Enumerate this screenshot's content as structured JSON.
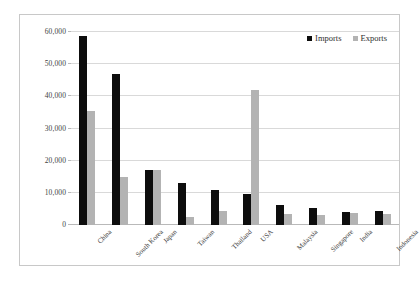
{
  "chart_data": {
    "type": "bar",
    "title": "",
    "subtitle": "",
    "xlabel": "",
    "ylabel": "",
    "ylim": [
      0,
      60000
    ],
    "ytick_labels": [
      "0",
      "10,000",
      "20,000",
      "30,000",
      "40,000",
      "50,000",
      "60,000"
    ],
    "ytick_values": [
      0,
      10000,
      20000,
      30000,
      40000,
      50000,
      60000
    ],
    "grid": true,
    "legend_position": "top-right",
    "categories": [
      "China",
      "South Korea",
      "Japan",
      "Taiwan",
      "Thailand",
      "USA",
      "Malaysia",
      "Singapore",
      "India",
      "Indonesia"
    ],
    "series": [
      {
        "name": "Imports",
        "color": "#0d0d0d",
        "values": [
          58800,
          47000,
          17000,
          13000,
          11000,
          9700,
          6300,
          5200,
          4200,
          4300
        ]
      },
      {
        "name": "Exports",
        "color": "#b3b3b3",
        "values": [
          35500,
          15000,
          17000,
          2500,
          4500,
          42000,
          3400,
          3200,
          3700,
          3300
        ]
      }
    ]
  },
  "legend": {
    "items": [
      {
        "label": "Imports",
        "swatch": "imports-swatch"
      },
      {
        "label": "Exports",
        "swatch": "exports-swatch"
      }
    ]
  }
}
